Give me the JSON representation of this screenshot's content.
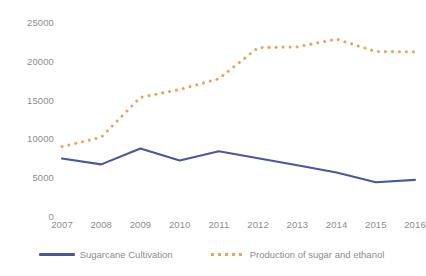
{
  "chart_data": {
    "type": "line",
    "title": "",
    "subtitle": "",
    "xlabel": "",
    "ylabel": "",
    "categories": [
      "2007",
      "2008",
      "2009",
      "2010",
      "2011",
      "2012",
      "2013",
      "2014",
      "2015",
      "2016"
    ],
    "series": [
      {
        "name": "Sugarcane Cultivation",
        "color": "#4a5899",
        "style": "solid",
        "values": [
          7400,
          6650,
          8700,
          7150,
          8350,
          7450,
          6550,
          5600,
          4350,
          4650
        ]
      },
      {
        "name": "Production of sugar and ethanol",
        "color": "#e8a35c",
        "style": "dotted",
        "values": [
          8950,
          10150,
          15300,
          16300,
          17700,
          21700,
          21800,
          22800,
          21200,
          21150
        ]
      }
    ],
    "ylim": [
      0,
      25000
    ],
    "y_ticks": [
      0,
      5000,
      10000,
      15000,
      20000,
      25000
    ],
    "y_tick_labels": [
      "0",
      "5000",
      "10000",
      "15000",
      "20000",
      "25000"
    ],
    "grid": false,
    "legend_position": "bottom",
    "axis_label_color": "#8d8d8d"
  }
}
